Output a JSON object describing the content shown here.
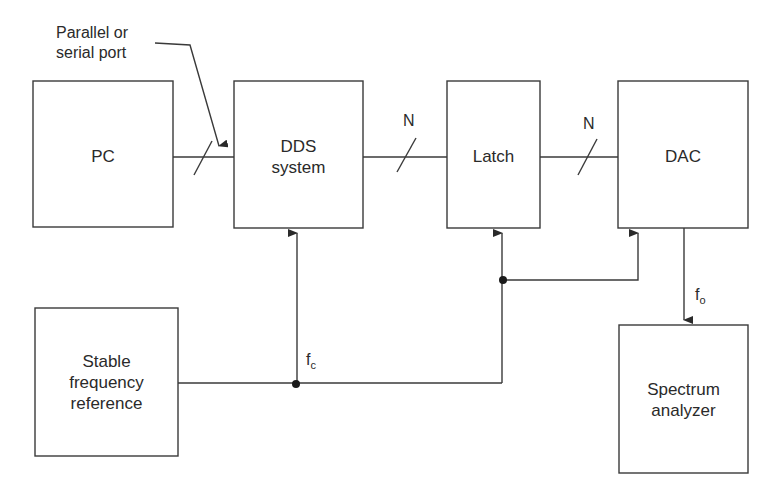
{
  "diagram": {
    "type": "block-diagram",
    "blocks": {
      "pc": "PC",
      "dds": [
        "DDS",
        "system"
      ],
      "latch": "Latch",
      "dac": "DAC",
      "reference": [
        "Stable",
        "frequency",
        "reference"
      ],
      "analyzer": [
        "Spectrum",
        "analyzer"
      ]
    },
    "annotations": {
      "port": [
        "Parallel or",
        "serial port"
      ],
      "bus_width_1": "N",
      "bus_width_2": "N",
      "clock_f": "f",
      "clock_sub": "c",
      "output_f": "f",
      "output_sub": "o"
    },
    "colors": {
      "line": "#3a3a3a",
      "text": "#2a2a2a",
      "background": "#ffffff"
    }
  }
}
